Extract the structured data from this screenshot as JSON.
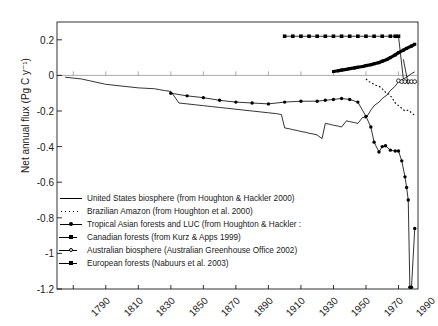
{
  "chart_data": {
    "type": "line",
    "title": "",
    "xlabel": "",
    "ylabel": "Net annual flux (Pg C y-1)",
    "ylabel_display": "Net annual flux (Pg C y⁻¹)",
    "xlim": [
      1780,
      2002
    ],
    "ylim": [
      -1.2,
      0.3
    ],
    "yticks": [
      0.2,
      0,
      -0.2,
      -0.4,
      -0.6,
      -0.8,
      -1,
      -1.2
    ],
    "ytick_labels": [
      "0.2",
      "0",
      "-0.2",
      "-0.4",
      "-0.6",
      "-0.8",
      "-1",
      "-1.2"
    ],
    "xticks": [
      1790,
      1810,
      1830,
      1850,
      1870,
      1890,
      1910,
      1930,
      1950,
      1970,
      1990
    ],
    "xtick_labels": [
      "1790",
      "1810",
      "1830",
      "1850",
      "1870",
      "1890",
      "1910",
      "1930",
      "1950",
      "1970",
      "1990"
    ],
    "grid": false,
    "legend_position": "lower-left-inside",
    "series": [
      {
        "name": "United States biosphere (from Houghton & Hackler 2000)",
        "style": "solid-line",
        "marker": "none",
        "color": "#000000",
        "x": [
          1785,
          1795,
          1800,
          1810,
          1820,
          1830,
          1840,
          1843,
          1846,
          1850,
          1855,
          1860,
          1865,
          1870,
          1875,
          1880,
          1885,
          1890,
          1895,
          1900,
          1905,
          1910,
          1915,
          1918,
          1920,
          1923,
          1925,
          1928,
          1930,
          1933,
          1935,
          1938,
          1940,
          1943,
          1945,
          1948,
          1950,
          1953,
          1955,
          1958,
          1960,
          1963,
          1965,
          1968,
          1970,
          1973,
          1975,
          1978,
          1980,
          1983,
          1985,
          1988,
          1990,
          1993,
          1995,
          1998,
          2000
        ],
        "y": [
          -0.01,
          -0.02,
          -0.03,
          -0.05,
          -0.06,
          -0.07,
          -0.075,
          -0.08,
          -0.085,
          -0.09,
          -0.155,
          -0.16,
          -0.165,
          -0.17,
          -0.175,
          -0.18,
          -0.185,
          -0.19,
          -0.195,
          -0.2,
          -0.205,
          -0.21,
          -0.215,
          -0.22,
          -0.295,
          -0.3,
          -0.305,
          -0.31,
          -0.315,
          -0.32,
          -0.325,
          -0.33,
          -0.335,
          -0.355,
          -0.27,
          -0.275,
          -0.28,
          -0.285,
          -0.29,
          -0.255,
          -0.26,
          -0.265,
          -0.27,
          -0.235,
          -0.24,
          -0.195,
          -0.17,
          -0.15,
          -0.13,
          -0.11,
          -0.085,
          -0.06,
          -0.035,
          -0.02,
          -0.01,
          0.01,
          0.02
        ]
      },
      {
        "name": "Brazilian Amazon (from Houghton et al. 2000)",
        "style": "dotted-line",
        "marker": "none",
        "color": "#000000",
        "x": [
          1970,
          1972,
          1974,
          1976,
          1978,
          1980,
          1982,
          1984,
          1986,
          1988,
          1990,
          1992,
          1994,
          1996,
          1998,
          2000
        ],
        "y": [
          -0.02,
          -0.035,
          -0.045,
          -0.055,
          -0.06,
          -0.075,
          -0.095,
          -0.105,
          -0.125,
          -0.155,
          -0.17,
          -0.185,
          -0.2,
          -0.195,
          -0.21,
          -0.225
        ]
      },
      {
        "name": "Tropical Asian forests and LUC (from Houghton & Hackler 2000)",
        "style": "solid-line",
        "marker": "filled-circle",
        "color": "#000000",
        "x": [
          1850,
          1860,
          1870,
          1880,
          1890,
          1900,
          1910,
          1920,
          1930,
          1940,
          1945,
          1950,
          1955,
          1960,
          1965,
          1970,
          1973,
          1975,
          1978,
          1980,
          1982,
          1985,
          1988,
          1990,
          1992,
          1994,
          1995,
          1996,
          1997,
          1998,
          2000
        ],
        "y": [
          -0.1,
          -0.115,
          -0.125,
          -0.14,
          -0.15,
          -0.155,
          -0.16,
          -0.15,
          -0.145,
          -0.145,
          -0.14,
          -0.135,
          -0.13,
          -0.135,
          -0.15,
          -0.23,
          -0.29,
          -0.375,
          -0.43,
          -0.4,
          -0.395,
          -0.42,
          -0.425,
          -0.425,
          -0.48,
          -0.57,
          -0.63,
          -0.7,
          -1.19,
          -1.19,
          -0.86
        ]
      },
      {
        "name": "Canadian forests (from Kurz & Apps 1999)",
        "style": "solid-line",
        "marker": "filled-square",
        "color": "#000000",
        "x": [
          1920,
          1925,
          1930,
          1935,
          1940,
          1945,
          1950,
          1955,
          1960,
          1965,
          1970,
          1975,
          1980,
          1985,
          1988,
          1990
        ],
        "y": [
          0.22,
          0.22,
          0.22,
          0.22,
          0.22,
          0.22,
          0.22,
          0.22,
          0.22,
          0.22,
          0.22,
          0.22,
          0.22,
          0.22,
          0.22,
          0.22
        ]
      },
      {
        "name": "Australian biosphere (Australian Greenhouse Office 2002)",
        "style": "solid-line",
        "marker": "open-circle",
        "color": "#000000",
        "x": [
          1990,
          1992,
          1994,
          1996,
          1998,
          2000
        ],
        "y": [
          -0.03,
          -0.035,
          -0.035,
          -0.035,
          -0.035,
          -0.035
        ]
      },
      {
        "name": "European forests (Nabuurs et al. 2003)",
        "style": "thick-line",
        "marker": "filled-square-small",
        "color": "#000000",
        "x": [
          1950,
          1953,
          1955,
          1958,
          1960,
          1963,
          1965,
          1968,
          1970,
          1973,
          1975,
          1978,
          1980,
          1983,
          1985,
          1988,
          1990,
          1993,
          1995,
          1998,
          2000
        ],
        "y": [
          0.022,
          0.026,
          0.03,
          0.034,
          0.038,
          0.042,
          0.046,
          0.05,
          0.055,
          0.06,
          0.065,
          0.072,
          0.08,
          0.09,
          0.1,
          0.115,
          0.128,
          0.142,
          0.152,
          0.165,
          0.175
        ]
      }
    ],
    "annotations": [
      {
        "text": "Canadian forests drop line",
        "from_x": 1990,
        "from_y": 0.22,
        "to_x": 1993,
        "to_y": -0.02
      },
      {
        "text": "Canadian forests drop line 2",
        "from_x": 1993,
        "from_y": 0.09,
        "to_x": 1996,
        "to_y": -0.05
      }
    ]
  },
  "legend": {
    "entries": [
      {
        "label": "United States biosphere (from Houghton & Hackler 2000)",
        "marker": "solid-line"
      },
      {
        "label": "Brazilian Amazon (from Houghton et al. 2000)",
        "marker": "dotted-line"
      },
      {
        "label": "Tropical Asian forests and LUC (from Houghton & Hackler :",
        "marker": "line-circle"
      },
      {
        "label": "Canadian forests (from Kurz & Apps 1999)",
        "marker": "line-square"
      },
      {
        "label": "Australian biosphere (Australian Greenhouse Office 2002)",
        "marker": "line-open-circle"
      },
      {
        "label": "European forests (Nabuurs et al. 2003)",
        "marker": "line-filled-square"
      }
    ]
  }
}
